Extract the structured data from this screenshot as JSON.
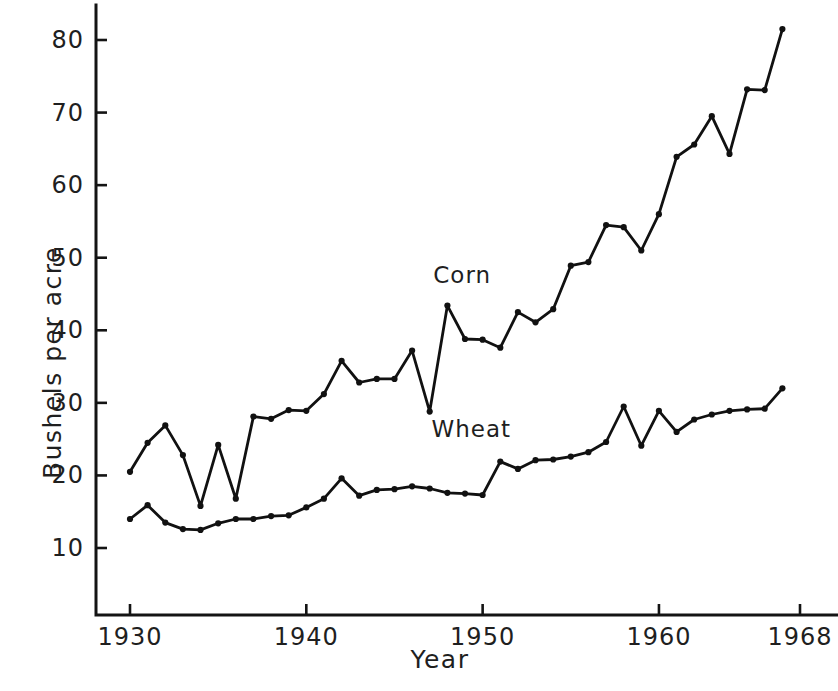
{
  "chart_data": {
    "type": "line",
    "title": "",
    "xlabel": "Year",
    "ylabel": "Bushels per acre",
    "xlim": [
      1929.5,
      1968
    ],
    "ylim": [
      5,
      84
    ],
    "grid": false,
    "legend_position": "inline-labels",
    "x_ticks": [
      1930,
      1940,
      1950,
      1960,
      1968
    ],
    "x_tick_labels": [
      "1930",
      "1940",
      "1950",
      "1960",
      "1968"
    ],
    "y_ticks": [
      10,
      20,
      30,
      40,
      50,
      60,
      70,
      80
    ],
    "y_tick_labels": [
      "10",
      "20",
      "30",
      "40",
      "50",
      "60",
      "70",
      "80"
    ],
    "x": [
      1930,
      1931,
      1932,
      1933,
      1934,
      1935,
      1936,
      1937,
      1938,
      1939,
      1940,
      1941,
      1942,
      1943,
      1944,
      1945,
      1946,
      1947,
      1948,
      1949,
      1950,
      1951,
      1952,
      1953,
      1954,
      1955,
      1956,
      1957,
      1958,
      1959,
      1960,
      1961,
      1962,
      1963,
      1964,
      1965,
      1966,
      1967
    ],
    "series": [
      {
        "name": "Corn",
        "color": "#111111",
        "marker": "circle",
        "label_x": 1947.2,
        "label_y": 47.5,
        "values": [
          20.5,
          24.5,
          26.9,
          22.8,
          15.8,
          24.2,
          16.8,
          28.1,
          27.8,
          29.0,
          28.9,
          31.2,
          35.8,
          32.8,
          33.3,
          33.3,
          37.2,
          28.8,
          43.4,
          38.8,
          38.7,
          37.6,
          42.5,
          41.1,
          42.9,
          48.9,
          49.4,
          54.5,
          54.2,
          51.0,
          56.0,
          63.9,
          65.6,
          69.5,
          64.3,
          73.2,
          73.1,
          81.5
        ]
      },
      {
        "name": "Wheat",
        "color": "#111111",
        "marker": "circle",
        "label_x": 1947.1,
        "label_y": 26.2,
        "values": [
          14.0,
          15.9,
          13.5,
          12.6,
          12.5,
          13.4,
          14.0,
          14.0,
          14.4,
          14.5,
          15.6,
          16.8,
          19.6,
          17.2,
          18.0,
          18.1,
          18.5,
          18.2,
          17.6,
          17.5,
          17.3,
          21.9,
          20.9,
          22.1,
          22.2,
          22.6,
          23.2,
          24.6,
          29.5,
          24.1,
          28.9,
          26.0,
          27.7,
          28.4,
          28.9,
          29.1,
          29.2,
          32.0
        ]
      }
    ]
  },
  "axis_style": {
    "line_color": "#141414",
    "line_width": 3,
    "tick_length": 11
  }
}
